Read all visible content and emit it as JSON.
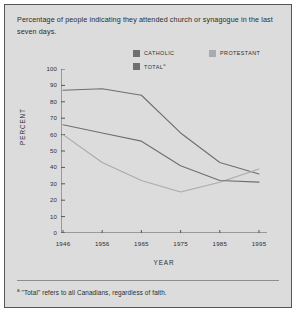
{
  "figure": {
    "title": "Percentage of people indicating they attended church or synagogue in the last seven days.",
    "footnote_marker": "a",
    "footnote": "\"Total\" refers to all Canadians, regardless of faith.",
    "background_color": "#dcdcdc",
    "border_color": "#55565a"
  },
  "legend": {
    "position": "top-center",
    "entries": [
      {
        "label": "CATHOLIC",
        "color": "#6e6f72",
        "marker_suffix": ""
      },
      {
        "label": "PROTESTANT",
        "color": "#a9aaad",
        "marker_suffix": ""
      },
      {
        "label": "TOTAL",
        "color": "#6e6f72",
        "marker_suffix": "a"
      }
    ]
  },
  "axes": {
    "ylabel": "PERCENT",
    "xlabel": "YEAR",
    "yticks": [
      "100",
      "90",
      "80",
      "70",
      "60",
      "50",
      "40",
      "30",
      "20",
      "10",
      "0"
    ],
    "xticks": [
      "1946",
      "1956",
      "1965",
      "1975",
      "1985",
      "1995"
    ],
    "ylim": [
      0,
      100
    ],
    "grid": false
  },
  "chart_data": {
    "type": "line",
    "title": "Percentage of people indicating they attended church or synagogue in the last seven days.",
    "xlabel": "YEAR",
    "ylabel": "PERCENT",
    "ylim": [
      0,
      100
    ],
    "grid": false,
    "x": [
      1946,
      1956,
      1965,
      1975,
      1985,
      1995
    ],
    "categories": [
      "1946",
      "1956",
      "1965",
      "1975",
      "1985",
      "1995"
    ],
    "series": [
      {
        "name": "CATHOLIC",
        "color": "#6e6f72",
        "values": [
          87,
          88,
          84,
          61,
          43,
          36
        ]
      },
      {
        "name": "PROTESTANT",
        "color": "#a9aaad",
        "values": [
          60,
          43,
          32,
          25,
          31,
          39
        ]
      },
      {
        "name": "TOTAL",
        "color": "#6e6f72",
        "values": [
          66,
          61,
          56,
          41,
          32,
          31
        ]
      }
    ],
    "annotations": [
      "\"Total\" refers to all Canadians, regardless of faith."
    ]
  }
}
